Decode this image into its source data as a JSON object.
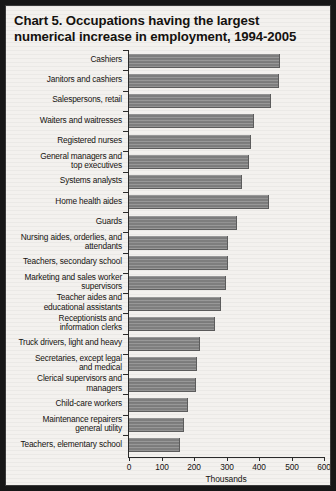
{
  "title": {
    "line1": "Chart 5. Occupations having the largest",
    "line2": "numerical increase in employment, 1994-2005"
  },
  "axis": {
    "xlabel": "Thousands",
    "ticks": [
      "0",
      "100",
      "200",
      "300",
      "400",
      "500",
      "600"
    ]
  },
  "colors": {
    "page": "#f3f1ee",
    "frame": "#171717",
    "bar": "#7e7e7e",
    "ink": "#161310"
  },
  "chart_data": {
    "type": "bar",
    "orientation": "horizontal",
    "title": "Chart 5. Occupations having the largest numerical increase in employment, 1994-2005",
    "xlabel": "Thousands",
    "ylabel": "",
    "xlim": [
      0,
      600
    ],
    "xticks": [
      0,
      100,
      200,
      300,
      400,
      500,
      600
    ],
    "grid": false,
    "legend": false,
    "categories": [
      "Cashiers",
      "Janitors and cashiers",
      "Salespersons, retail",
      "Waiters and waitresses",
      "Registered nurses",
      "General managers and top executives",
      "Systems analysts",
      "Home health aides",
      "Guards",
      "Nursing aides, orderlies, and attendants",
      "Teachers, secondary school",
      "Marketing and sales worker supervisors",
      "Teacher aides and educational assistants",
      "Receptionists and information clerks",
      "Truck drivers, light and heavy",
      "Secretaries, except legal and medical",
      "Clerical supervisors and managers",
      "Child-care workers",
      "Maintenance repairers general utility",
      "Teachers, elementary school"
    ],
    "values": [
      462,
      459,
      433,
      380,
      373,
      366,
      345,
      428,
      328,
      387,
      386,
      340,
      364,
      318,
      271,
      287,
      261,
      248,
      202,
      220
    ]
  },
  "rows": [
    {
      "label": [
        "Cashiers"
      ],
      "value": 462
    },
    {
      "label": [
        "Janitors and cashiers"
      ],
      "value": 459
    },
    {
      "label": [
        "Salespersons, retail"
      ],
      "value": 433
    },
    {
      "label": [
        "Waiters and waitresses"
      ],
      "value": 380
    },
    {
      "label": [
        "Registered nurses"
      ],
      "value": 373
    },
    {
      "label": [
        "General managers and",
        "top executives"
      ],
      "value": 366
    },
    {
      "label": [
        "Systems analysts"
      ],
      "value": 345
    },
    {
      "label": [
        "Home health aides"
      ],
      "value": 428
    },
    {
      "label": [
        "Guards"
      ],
      "value": 328
    },
    {
      "label": [
        "Nursing aides, orderlies, and",
        "attendants"
      ],
      "value": 300
    },
    {
      "label": [
        "Teachers, secondary school"
      ],
      "value": 300
    },
    {
      "label": [
        "Marketing and sales worker",
        "supervisors"
      ],
      "value": 296
    },
    {
      "label": [
        "Teacher aides and",
        "educational assistants"
      ],
      "value": 279
    },
    {
      "label": [
        "Receptionists and",
        "information clerks"
      ],
      "value": 260
    },
    {
      "label": [
        "Truck drivers, light and heavy"
      ],
      "value": 214
    },
    {
      "label": [
        "Secretaries, except legal",
        "and medical"
      ],
      "value": 206
    },
    {
      "label": [
        "Clerical supervisors and",
        "managers"
      ],
      "value": 203
    },
    {
      "label": [
        "Child-care workers"
      ],
      "value": 179
    },
    {
      "label": [
        "Maintenance repairers",
        "general utility"
      ],
      "value": 167
    },
    {
      "label": [
        "Teachers, elementary school"
      ],
      "value": 155
    }
  ]
}
